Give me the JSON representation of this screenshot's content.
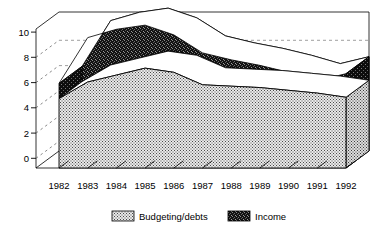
{
  "chart_data": {
    "type": "area",
    "title": "",
    "subtitle": "",
    "xlabel": "",
    "ylabel": "",
    "stacked": true,
    "three_d": true,
    "grid": true,
    "legend_position": "bottom",
    "ylim": [
      0,
      11
    ],
    "yticks": [
      0,
      2,
      4,
      6,
      8,
      10
    ],
    "ytick_labels": [
      "0",
      "2",
      "4",
      "6",
      "8",
      "10"
    ],
    "categories": [
      "1982",
      "1983",
      "1984",
      "1985",
      "1986",
      "1987",
      "1988",
      "1989",
      "1990",
      "1991",
      "1992"
    ],
    "series": [
      {
        "name": "Budgeting/debts",
        "color": "#d8d8d8",
        "pattern": "fine-checker",
        "values": [
          5.0,
          6.2,
          6.7,
          7.2,
          6.9,
          6.0,
          5.9,
          5.8,
          5.6,
          5.4,
          5.1
        ]
      },
      {
        "name": "Income",
        "color": "#1a1a1a",
        "pattern": "dense-noise",
        "values": [
          1.1,
          3.2,
          3.3,
          3.1,
          2.7,
          2.3,
          1.9,
          1.6,
          1.3,
          0.9,
          1.7
        ]
      }
    ],
    "totals": [
      6.1,
      9.4,
      10.0,
      10.3,
      9.6,
      8.3,
      7.8,
      7.4,
      6.9,
      6.3,
      6.8
    ]
  },
  "legend": {
    "items": [
      {
        "label": "Budgeting/debts",
        "swatch": "fine-checker"
      },
      {
        "label": "Income",
        "swatch": "dense-noise"
      }
    ]
  }
}
